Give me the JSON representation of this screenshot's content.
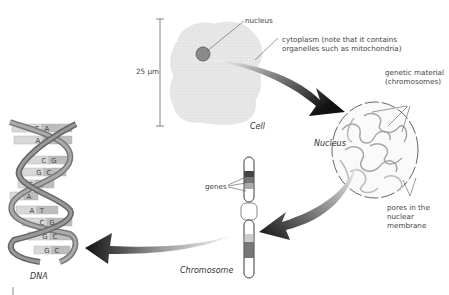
{
  "diagram": {
    "stages": [
      {
        "id": "cell",
        "title": "Cell"
      },
      {
        "id": "nucleus",
        "title": "Nucleus"
      },
      {
        "id": "chromosome",
        "title": "Chromosome"
      },
      {
        "id": "dna",
        "title": "DNA"
      }
    ],
    "labels": {
      "scale": "25 μm",
      "nucleus": "nucleus",
      "cytoplasm_line1": "cytoplasm (note that it contains",
      "cytoplasm_line2": "organelles such as mitochondria)",
      "genetic_line1": "genetic material",
      "genetic_line2": "(chromosomes)",
      "pores_line1": "pores in the",
      "pores_line2": "nuclear",
      "pores_line3": "membrane",
      "genes": "genes"
    },
    "dna_base_pairs": [
      [
        "T",
        "A"
      ],
      [
        "A",
        "T"
      ],
      [
        "C",
        "G"
      ],
      [
        "G",
        "C"
      ],
      [
        "G",
        "C"
      ],
      [
        "T",
        "A"
      ],
      [
        "A",
        "T"
      ],
      [
        "C",
        "G"
      ],
      [
        "G",
        "C"
      ],
      [
        "G",
        "C"
      ]
    ],
    "colors": {
      "cell_fill": "#e6e6e6",
      "nucleus_fill": "#8a8a8a",
      "arrow_dark": "#111111",
      "strand": "#777777",
      "line": "#555555"
    }
  }
}
